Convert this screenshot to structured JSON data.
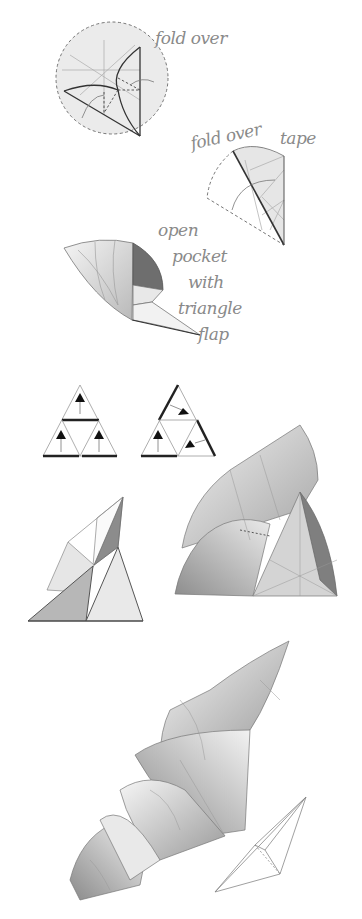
{
  "diagram": {
    "type": "origami-instructions",
    "colors": {
      "line": "#555555",
      "fold_line": "#9a9a9a",
      "paper_light": "#ececec",
      "paper_mid": "#bdbdbd",
      "paper_dark": "#6e6e6e",
      "ink": "#1a1a1a",
      "label": "#8a8a8a"
    },
    "steps": [
      {
        "id": "step-1",
        "label": "fold over"
      },
      {
        "id": "step-2",
        "labels": [
          "fold over",
          "tape"
        ]
      },
      {
        "id": "step-3",
        "label_lines": [
          "open",
          "pocket",
          "with",
          "triangle",
          "flap"
        ]
      },
      {
        "id": "step-4",
        "description": "triangle arrangement diagrams (2 variants)"
      },
      {
        "id": "step-5",
        "description": "assembled triangle modules"
      },
      {
        "id": "step-6",
        "description": "final assembled form with wireframe"
      }
    ]
  }
}
